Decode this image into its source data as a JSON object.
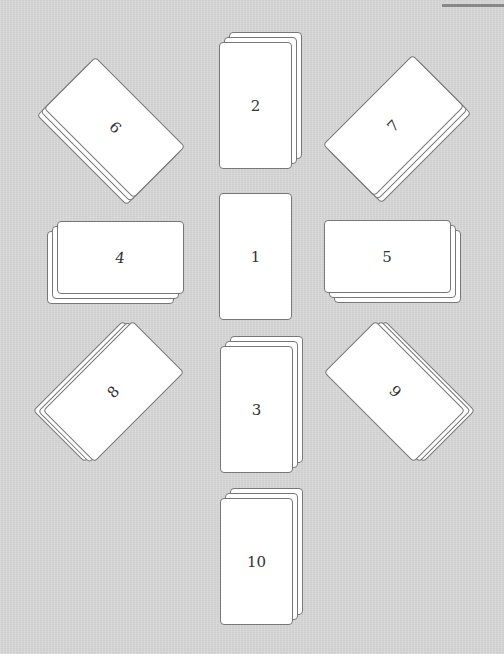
{
  "diagram": {
    "type": "card-spread",
    "background_color": "#d7d7d7",
    "card_fill": "#ffffff",
    "card_border": "#777777",
    "positions": [
      {
        "id": "1",
        "label": "1",
        "stack": 1,
        "orientation": "upright"
      },
      {
        "id": "2",
        "label": "2",
        "stack": 3,
        "orientation": "upright"
      },
      {
        "id": "3",
        "label": "3",
        "stack": 3,
        "orientation": "upright"
      },
      {
        "id": "4",
        "label": "4",
        "stack": 3,
        "orientation": "horizontal"
      },
      {
        "id": "5",
        "label": "5",
        "stack": 3,
        "orientation": "horizontal"
      },
      {
        "id": "6",
        "label": "6",
        "stack": 3,
        "orientation": "diagonal-left"
      },
      {
        "id": "7",
        "label": "7",
        "stack": 3,
        "orientation": "diagonal-right"
      },
      {
        "id": "8",
        "label": "8",
        "stack": 3,
        "orientation": "diagonal-right"
      },
      {
        "id": "9",
        "label": "9",
        "stack": 3,
        "orientation": "diagonal-left"
      },
      {
        "id": "10",
        "label": "10",
        "stack": 3,
        "orientation": "upright"
      }
    ]
  }
}
